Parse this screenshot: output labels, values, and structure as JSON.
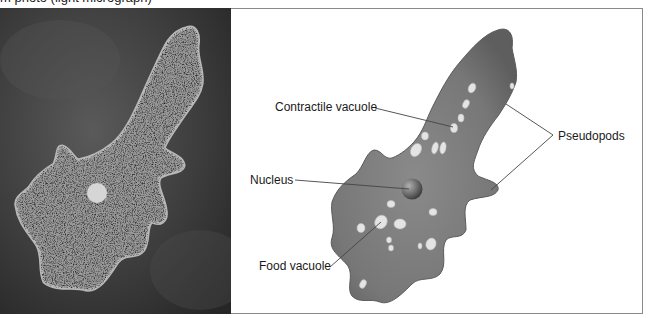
{
  "figure": {
    "caption_fragment": "m photo (light micrograph)",
    "left_panel": {
      "type": "light micrograph",
      "subject": "amoeba"
    },
    "right_panel": {
      "type": "illustration",
      "subject": "amoeba",
      "labels": {
        "contractile_vacuole": "Contractile vacuole",
        "nucleus": "Nucleus",
        "food_vacuole": "Food vacuole",
        "pseudopods": "Pseudopods"
      }
    },
    "colors": {
      "frame": "#8a8a8a",
      "photo_background": "#3a3a3a",
      "cell_body": "#7a7a7a",
      "leader_line": "#444444",
      "label_text": "#1a1a1a"
    }
  }
}
